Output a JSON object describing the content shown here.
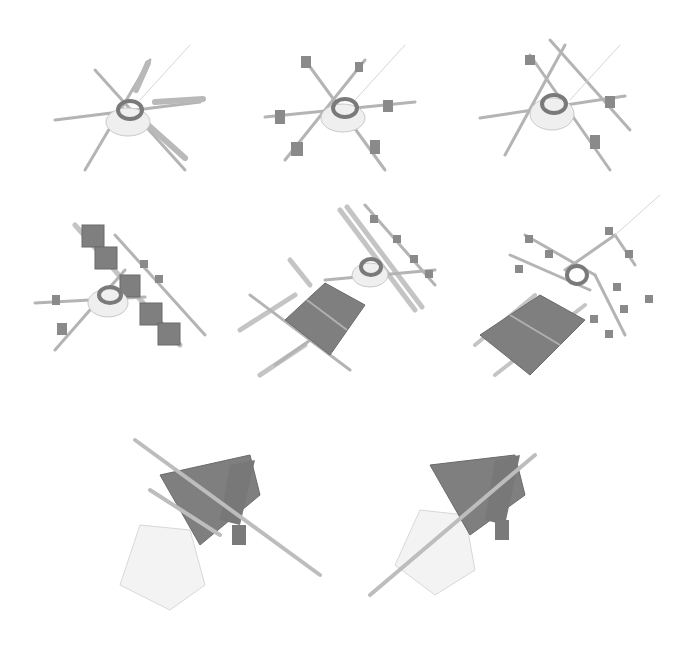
{
  "figure": {
    "layout": "grid of 3D renderings, rows: 3, 3, 2",
    "background": "#ffffff",
    "palette": {
      "rod": "#b4b4b4",
      "dark": "#7a7a7a",
      "light": "#d6d6d6",
      "sheet": "#f1f1f1"
    },
    "panels": [
      {
        "id": 1,
        "subject": "hub with six radial rods/oars"
      },
      {
        "id": 2,
        "subject": "hub with radial rods and attached blocks"
      },
      {
        "id": 3,
        "subject": "hub with crossing rods and blocks"
      },
      {
        "id": 4,
        "subject": "hub with a row of box modules on a rail"
      },
      {
        "id": 5,
        "subject": "assembled grid panel with crossed oars and hub"
      },
      {
        "id": 6,
        "subject": "grid panel with branching node tree and ring"
      },
      {
        "id": 7,
        "subject": "folded structure with translucent sheet and long oar"
      },
      {
        "id": 8,
        "subject": "folded structure with translucent sheet and long oar (mirrored)"
      }
    ]
  }
}
